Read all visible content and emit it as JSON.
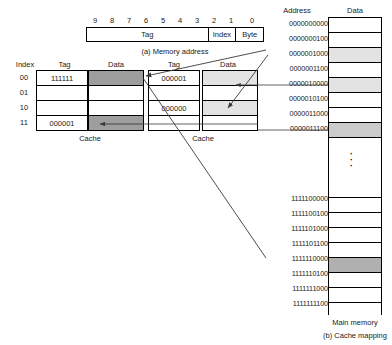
{
  "figure": {
    "part_a_caption": "(a) Memory address",
    "part_b_caption": "(b) Cache mapping",
    "main_memory_label": "Main memory"
  },
  "memory_address": {
    "bit_labels": [
      "9",
      "8",
      "7",
      "6",
      "5",
      "4",
      "3",
      "2",
      "1",
      "0"
    ],
    "fields": [
      {
        "name": "Tag",
        "label": "Tag"
      },
      {
        "name": "Index",
        "label": "Index"
      },
      {
        "name": "Byte",
        "label": "Byte"
      }
    ]
  },
  "cache_left": {
    "label": "Cache",
    "index_header": "Index",
    "tag_header": "Tag",
    "data_header": "Data",
    "rows": [
      {
        "index": "00",
        "tag": "111111",
        "data": "",
        "data_fill": "#9e9e9e"
      },
      {
        "index": "01",
        "tag": "",
        "data": "",
        "data_fill": "#ffffff"
      },
      {
        "index": "10",
        "tag": "",
        "data": "",
        "data_fill": "#ffffff"
      },
      {
        "index": "11",
        "tag": "000001",
        "data": "",
        "data_fill": "#9e9e9e"
      }
    ]
  },
  "cache_right": {
    "label": "Cache",
    "tag_header": "Tag",
    "data_header": "Data",
    "rows": [
      {
        "tag": "000001",
        "data": "",
        "data_fill": "#e3e3e3"
      },
      {
        "tag": "",
        "data": "",
        "data_fill": "#ffffff"
      },
      {
        "tag": "000000",
        "data": "",
        "data_fill": "#e3e3e3"
      },
      {
        "tag": "",
        "data": "",
        "data_fill": "#ffffff"
      }
    ]
  },
  "main_memory": {
    "address_header": "Address",
    "data_header": "Data",
    "upper_rows": [
      {
        "address": "0000000000",
        "fill": "#ffffff"
      },
      {
        "address": "0000000100",
        "fill": "#ffffff"
      },
      {
        "address": "0000001000",
        "fill": "#e3e3e3"
      },
      {
        "address": "0000001100",
        "fill": "#ffffff"
      },
      {
        "address": "0000010000",
        "fill": "#e3e3e3"
      },
      {
        "address": "0000010100",
        "fill": "#ffffff"
      },
      {
        "address": "0000011000",
        "fill": "#ffffff"
      },
      {
        "address": "0000011100",
        "fill": "#cbcbcb"
      }
    ],
    "ellipsis": "vertical-dots",
    "lower_rows": [
      {
        "address": "1111100000",
        "fill": "#ffffff"
      },
      {
        "address": "1111100100",
        "fill": "#ffffff"
      },
      {
        "address": "1111101000",
        "fill": "#ffffff"
      },
      {
        "address": "1111101100",
        "fill": "#ffffff"
      },
      {
        "address": "1111110000",
        "fill": "#b0b0b0"
      },
      {
        "address": "1111110100",
        "fill": "#ffffff"
      },
      {
        "address": "1111111000",
        "fill": "#ffffff"
      },
      {
        "address": "1111111100",
        "fill": "#ffffff"
      }
    ]
  },
  "style": {
    "line_color": "#000000",
    "arrow_color": "#3a3a3a"
  }
}
